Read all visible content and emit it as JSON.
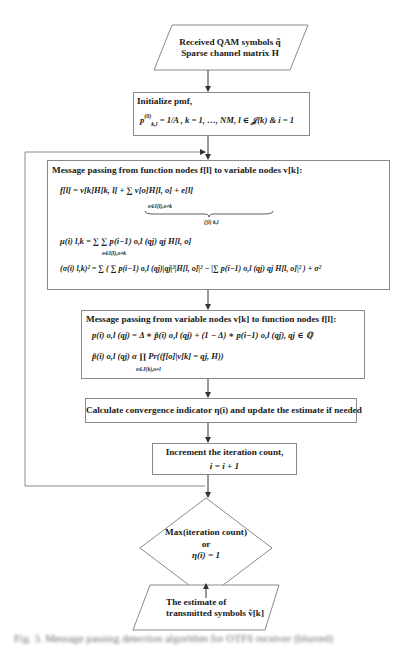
{
  "flowchart": {
    "input": {
      "line1": "Received QAM symbols q̃",
      "line2": "Sparse channel matrix H"
    },
    "init": {
      "title": "Initialize pmf,",
      "equation": "p_{k,l}^{(0)} = 1/A, k = 1, …, NM, l ∈ J(k) & i = 1",
      "eq_lhs": "p",
      "eq_sup": "(0)",
      "eq_sub": "k,l",
      "eq_rhs": "= 1/A , k = 1, …, NM, l ∈ 𝒥(k) & i = 1"
    },
    "f_to_v": {
      "title": "Message passing from function nodes f[l] to variable nodes v[k]:",
      "eq1_main": "f[l] = v[k]H[k, l] + ∑ v[o]H[l, o] + e[l]",
      "eq1_sum_sub": "o∈I(l),o≠k",
      "eq1_underbrace_label": "ζ(i) k,l",
      "eq2": "μ(i) l,k = ∑ ∑ p(i−1) o,l (qj) qj H[l, o]",
      "eq2_sum_sub": "o∈I(l),o≠k",
      "eq2_inner_sub": "j=1",
      "eq2_inner_sup": "A",
      "eq3": "(σ(i) l,k)² = ∑ ( ∑ p(i−1) o,l (qj)|qj|²|H[l, o]|² − |∑ p(i−1) o,l (qj) qj H[l, o]|² ) + σ²"
    },
    "v_to_f": {
      "title": "Message passing from variable nodes v[k] to function nodes f[l]:",
      "eq1": "p(i) o,l (qj) = Δ ∗ p̃(i) o,l (qj) + (1 − Δ) ∗ p(i−1) o,l (qj), qj ∈ ℚ",
      "eq2": "p̃(i) o,l (qj) α ∏ Pr((f[o]|v[k] = qj, H))",
      "eq2_prod_sub": "o∈J(k),o≠l"
    },
    "convergence": {
      "label": "Calculate convergence indicator η(i) and update the estimate if needed"
    },
    "increment": {
      "line1": "Increment the iteration count,",
      "line2": "i = i + 1"
    },
    "decision": {
      "line1": "Max(iteration count)",
      "line2": "or",
      "line3": "η(i) = 1"
    },
    "output": {
      "line1": "The estimate of",
      "line2": "transmitted symbols v̂[k]"
    }
  },
  "caption": "Fig. 3. Message passing detection algorithm for OTFS receiver (blurred)"
}
